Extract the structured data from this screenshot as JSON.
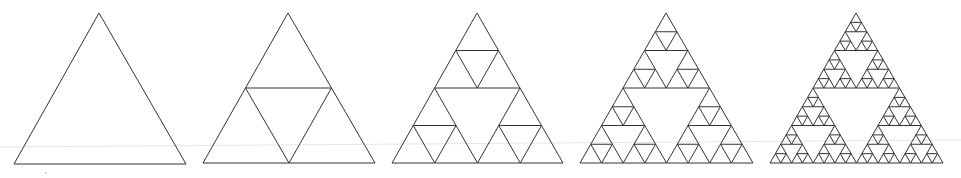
{
  "diagram": {
    "type": "fractal-progression",
    "stroke_color": "#333333",
    "background": "#ffffff",
    "iterations": [
      {
        "level": 0,
        "apex": [
          99,
          13
        ],
        "base_left": [
          14,
          164
        ],
        "base_right": [
          186,
          164
        ]
      },
      {
        "level": 1,
        "apex": [
          288,
          13
        ],
        "base_left": [
          203,
          163
        ],
        "base_right": [
          375,
          163
        ]
      },
      {
        "level": 2,
        "apex": [
          477,
          13
        ],
        "base_left": [
          392,
          163
        ],
        "base_right": [
          563,
          163
        ]
      },
      {
        "level": 3,
        "apex": [
          666,
          13
        ],
        "base_left": [
          580,
          163
        ],
        "base_right": [
          753,
          163
        ]
      },
      {
        "level": 4,
        "apex": [
          856,
          13
        ],
        "base_left": [
          770,
          163
        ],
        "base_right": [
          943,
          163
        ]
      }
    ],
    "artifacts": {
      "scan_line": {
        "from": [
          0,
          147
        ],
        "to": [
          961,
          140
        ],
        "color": "#e6e6e6"
      },
      "speck": [
        46,
        173
      ]
    }
  }
}
